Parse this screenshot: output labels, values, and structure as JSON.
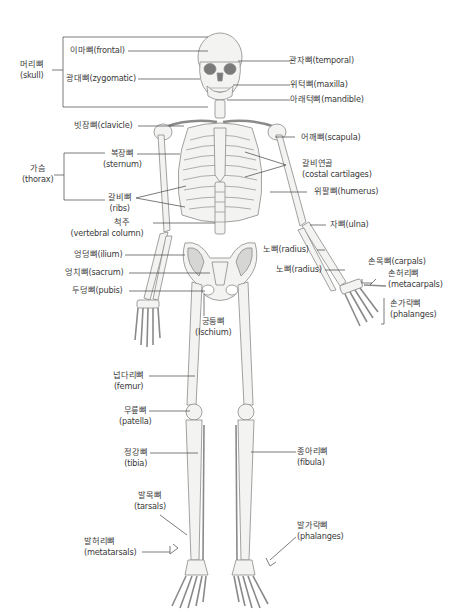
{
  "diagram": {
    "colors": {
      "bone_fill": "#f3f3f1",
      "bone_stroke": "#8a8a8a",
      "shade": "#d6d6d4",
      "dark": "#7a7a7a",
      "leader": "#444444"
    },
    "groups": {
      "skull": {
        "ko": "머리뼈",
        "en": "(skull)"
      },
      "thorax": {
        "ko": "가슴",
        "en": "(thorax)"
      }
    },
    "labels_left": {
      "frontal": "이마뼈(frontal)",
      "zygomatic": "광대뼈(zygomatic)",
      "clavicle": "빗장뼈(clavicle)",
      "sternum_ko": "복장뼈",
      "sternum_en": "(sternum)",
      "ribs_ko": "갈비뼈",
      "ribs_en": "(ribs)",
      "vertebral_ko": "척주",
      "vertebral_en": "(vertebral column)",
      "ilium": "엉덩뼈(ilium)",
      "sacrum": "엉치뼈(sacrum)",
      "pubis": "두덩뼈(pubis)",
      "femur_ko": "넙다리뼈",
      "femur_en": "(femur)",
      "patella_ko": "무릎뼈",
      "patella_en": "(patella)",
      "tibia_ko": "정강뼈",
      "tibia_en": "(tibia)",
      "tarsals_ko": "발목뼈",
      "tarsals_en": "(tarsals)",
      "metatarsals_ko": "발허리뼈",
      "metatarsals_en": "(metatarsals)"
    },
    "labels_center": {
      "ischium_ko": "궁둥뼈",
      "ischium_en": "(Ischium)",
      "radius_1": "노뼈(radius)",
      "radius_2": "노뼈(radius)"
    },
    "labels_right": {
      "temporal": "관자뼈(temporal)",
      "maxilla": "위턱뼈(maxilla)",
      "mandible": "아래턱뼈(mandible)",
      "scapula": "어깨뼈(scapula)",
      "costal_ko": "갈비연골",
      "costal_en": "(costal cartilages)",
      "humerus": "위팔뼈(humerus)",
      "ulna": "자뼈(ulna)",
      "carpals": "손목뼈(carpals)",
      "metacarpals_ko": "손허리뼈",
      "metacarpals_en": "(metacarpals)",
      "phalanges_hand_ko": "손가락뼈",
      "phalanges_hand_en": "(phalanges)",
      "fibula_ko": "종아리뼈",
      "fibula_en": "(fibula)",
      "phalanges_foot_ko": "발가락뼈",
      "phalanges_foot_en": "(phalanges)"
    }
  }
}
